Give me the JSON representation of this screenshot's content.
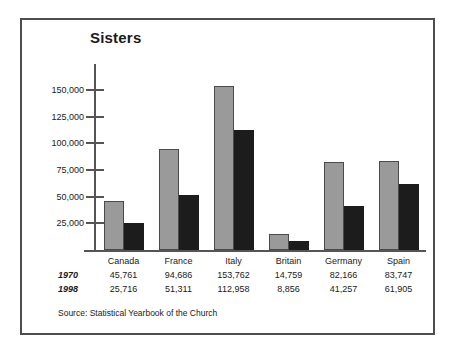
{
  "figure": {
    "title": "Sisters",
    "source": "Source: Statistical Yearbook of the Church",
    "border_color": "#4d4d4d",
    "background": "#ffffff"
  },
  "chart_data": {
    "type": "bar",
    "title": "Sisters",
    "xlabel": "",
    "ylabel": "",
    "categories": [
      "Canada",
      "France",
      "Italy",
      "Britain",
      "Germany",
      "Spain"
    ],
    "series": [
      {
        "name": "1970",
        "color": "#9a9a9a",
        "values": [
          45761,
          94686,
          153762,
          14759,
          82166,
          83747
        ],
        "labels": [
          "45,761",
          "94,686",
          "153,762",
          "14,759",
          "82,166",
          "83,747"
        ]
      },
      {
        "name": "1998",
        "color": "#1c1c1c",
        "values": [
          25716,
          51311,
          112958,
          8856,
          41257,
          61905
        ],
        "labels": [
          "25,716",
          "51,311",
          "112,958",
          "8,856",
          "41,257",
          "61,905"
        ]
      }
    ],
    "ylim": [
      0,
      160000
    ],
    "yticks": [
      25000,
      50000,
      75000,
      100000,
      125000,
      150000
    ],
    "ytick_labels": [
      "25,000",
      "50,000",
      "75,000",
      "100,000",
      "125,000",
      "150,000"
    ],
    "grid": false,
    "legend": "row-labels-in-table",
    "annotations": [
      "Source: Statistical Yearbook of the Church"
    ]
  },
  "table": {
    "column_headers": [
      "Canada",
      "France",
      "Italy",
      "Britain",
      "Germany",
      "Spain"
    ],
    "rows": [
      {
        "year": "1970",
        "values": [
          "45,761",
          "94,686",
          "153,762",
          "14,759",
          "82,166",
          "83,747"
        ]
      },
      {
        "year": "1998",
        "values": [
          "25,716",
          "51,311",
          "112,958",
          "8,856",
          "41,257",
          "61,905"
        ]
      }
    ]
  }
}
